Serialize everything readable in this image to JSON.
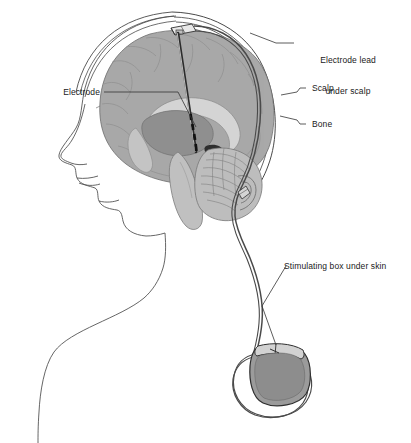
{
  "figure": {
    "background_color": "#ffffff",
    "line_color": "#3a3a3a",
    "text_color": "#1a1a1a"
  },
  "labels": {
    "electrode_lead": {
      "line1": "Electrode lead",
      "line2": "under scalp"
    },
    "scalp": "Scalp",
    "bone": "Bone",
    "electrode": "Electrode",
    "stimulating_box": "Stimulating box under skin"
  },
  "anatomy": {
    "head_profile": "head-and-shoulders-profile",
    "brain": "cerebrum-sagittal-section",
    "cerebellum": "cerebellum",
    "brainstem": "brainstem",
    "corpus_callosum": "corpus-callosum",
    "thalamus": "thalamus-target",
    "ventricle": "ventricle",
    "skull_layers": [
      "scalp",
      "bone",
      "dura"
    ]
  },
  "device": {
    "burr_hole_anchor": "burr-hole-anchor",
    "electrode_shaft": "electrode-shaft",
    "electrode_contacts": "electrode-contacts",
    "lead_wire": "extension-lead-wire",
    "lead_connector": "lead-connector",
    "pulse_generator": "implanted-pulse-generator",
    "generator_header": "generator-header-block"
  },
  "colors": {
    "cortex_gray": "#a9a9a9",
    "deep_gray": "#909090",
    "light_gray": "#c9c9c9",
    "pale_gray": "#d8d8d8",
    "device_gray": "#9b9b9b",
    "outline": "#3a3a3a"
  }
}
